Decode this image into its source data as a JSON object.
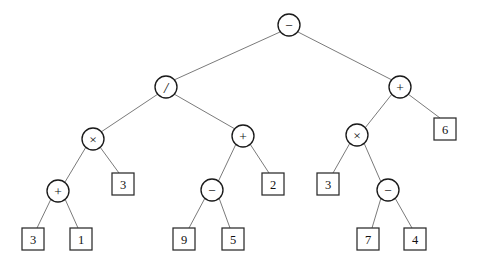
{
  "figure": {
    "kind": "binary-expression-tree",
    "background_color": "#ffffff",
    "edge_color": "#6b6b6b",
    "node_stroke_color": "#1a1a1a",
    "leaf_stroke_color": "#2a2a2a",
    "label_color": "#111111",
    "width": 478,
    "height": 272
  },
  "nodes": [
    {
      "id": "n0",
      "label": "−",
      "shape": "circle",
      "icon": "minus-operator-icon",
      "cx": 289,
      "cy": 25,
      "r": 11
    },
    {
      "id": "n1",
      "label": "/",
      "shape": "circle",
      "icon": "divide-operator-icon",
      "cx": 166,
      "cy": 87,
      "r": 11
    },
    {
      "id": "n2",
      "label": "+",
      "shape": "circle",
      "icon": "plus-operator-icon",
      "cx": 400,
      "cy": 87,
      "r": 11
    },
    {
      "id": "n3",
      "label": "×",
      "shape": "circle",
      "icon": "times-operator-icon",
      "cx": 93,
      "cy": 139,
      "r": 11
    },
    {
      "id": "n4",
      "label": "+",
      "shape": "circle",
      "icon": "plus-operator-icon",
      "cx": 243,
      "cy": 136,
      "r": 11
    },
    {
      "id": "n5",
      "label": "×",
      "shape": "circle",
      "icon": "times-operator-icon",
      "cx": 357,
      "cy": 135,
      "r": 11
    },
    {
      "id": "n6",
      "label": "6",
      "shape": "square",
      "icon": "leaf-value-box",
      "cx": 445,
      "cy": 129,
      "half": 11
    },
    {
      "id": "n7",
      "label": "+",
      "shape": "circle",
      "icon": "plus-operator-icon",
      "cx": 58,
      "cy": 191,
      "r": 11
    },
    {
      "id": "n8",
      "label": "3",
      "shape": "square",
      "icon": "leaf-value-box",
      "cx": 123,
      "cy": 184,
      "half": 11
    },
    {
      "id": "n9",
      "label": "−",
      "shape": "circle",
      "icon": "minus-operator-icon",
      "cx": 212,
      "cy": 190,
      "r": 11
    },
    {
      "id": "n10",
      "label": "2",
      "shape": "square",
      "icon": "leaf-value-box",
      "cx": 273,
      "cy": 184,
      "half": 11
    },
    {
      "id": "n11",
      "label": "3",
      "shape": "square",
      "icon": "leaf-value-box",
      "cx": 328,
      "cy": 184,
      "half": 11
    },
    {
      "id": "n12",
      "label": "−",
      "shape": "circle",
      "icon": "minus-operator-icon",
      "cx": 388,
      "cy": 190,
      "r": 11
    },
    {
      "id": "n13",
      "label": "3",
      "shape": "square",
      "icon": "leaf-value-box",
      "cx": 33,
      "cy": 239,
      "half": 11
    },
    {
      "id": "n14",
      "label": "1",
      "shape": "square",
      "icon": "leaf-value-box",
      "cx": 81,
      "cy": 239,
      "half": 11
    },
    {
      "id": "n15",
      "label": "9",
      "shape": "square",
      "icon": "leaf-value-box",
      "cx": 184,
      "cy": 239,
      "half": 11
    },
    {
      "id": "n16",
      "label": "5",
      "shape": "square",
      "icon": "leaf-value-box",
      "cx": 233,
      "cy": 239,
      "half": 11
    },
    {
      "id": "n17",
      "label": "7",
      "shape": "square",
      "icon": "leaf-value-box",
      "cx": 368,
      "cy": 239,
      "half": 11
    },
    {
      "id": "n18",
      "label": "4",
      "shape": "square",
      "icon": "leaf-value-box",
      "cx": 415,
      "cy": 239,
      "half": 11
    }
  ],
  "edges": [
    {
      "from": "n0",
      "to": "n1",
      "x1": 280,
      "y1": 32,
      "x2": 174,
      "y2": 80
    },
    {
      "from": "n0",
      "to": "n2",
      "x1": 298,
      "y1": 32,
      "x2": 392,
      "y2": 80
    },
    {
      "from": "n1",
      "to": "n3",
      "x1": 158,
      "y1": 94,
      "x2": 101,
      "y2": 132
    },
    {
      "from": "n1",
      "to": "n4",
      "x1": 174,
      "y1": 94,
      "x2": 235,
      "y2": 129
    },
    {
      "from": "n2",
      "to": "n5",
      "x1": 392,
      "y1": 94,
      "x2": 365,
      "y2": 128
    },
    {
      "from": "n2",
      "to": "n6",
      "x1": 408,
      "y1": 94,
      "x2": 440,
      "y2": 118
    },
    {
      "from": "n3",
      "to": "n7",
      "x1": 86,
      "y1": 147,
      "x2": 65,
      "y2": 182
    },
    {
      "from": "n3",
      "to": "n8",
      "x1": 100,
      "y1": 147,
      "x2": 119,
      "y2": 173
    },
    {
      "from": "n4",
      "to": "n9",
      "x1": 236,
      "y1": 144,
      "x2": 218,
      "y2": 182
    },
    {
      "from": "n4",
      "to": "n10",
      "x1": 250,
      "y1": 144,
      "x2": 269,
      "y2": 173
    },
    {
      "from": "n5",
      "to": "n11",
      "x1": 350,
      "y1": 143,
      "x2": 333,
      "y2": 173
    },
    {
      "from": "n5",
      "to": "n12",
      "x1": 364,
      "y1": 143,
      "x2": 381,
      "y2": 182
    },
    {
      "from": "n7",
      "to": "n13",
      "x1": 51,
      "y1": 199,
      "x2": 37,
      "y2": 228
    },
    {
      "from": "n7",
      "to": "n14",
      "x1": 65,
      "y1": 199,
      "x2": 78,
      "y2": 228
    },
    {
      "from": "n9",
      "to": "n15",
      "x1": 205,
      "y1": 198,
      "x2": 189,
      "y2": 228
    },
    {
      "from": "n9",
      "to": "n16",
      "x1": 219,
      "y1": 198,
      "x2": 230,
      "y2": 228
    },
    {
      "from": "n12",
      "to": "n17",
      "x1": 381,
      "y1": 198,
      "x2": 372,
      "y2": 228
    },
    {
      "from": "n12",
      "to": "n18",
      "x1": 395,
      "y1": 198,
      "x2": 412,
      "y2": 228
    }
  ]
}
